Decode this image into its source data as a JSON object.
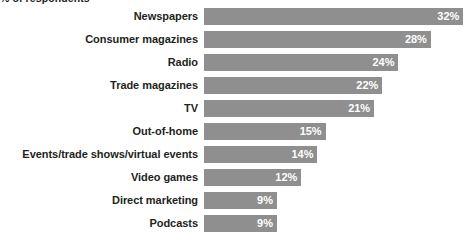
{
  "chart_data": {
    "type": "bar",
    "orientation": "horizontal",
    "title": "",
    "subtitle": "",
    "axis_note": "% of respondents",
    "xlabel": "",
    "ylabel": "",
    "grid": false,
    "legend": null,
    "value_suffix": "%",
    "xlim": [
      0,
      32
    ],
    "bar_color": "#8f8f8f",
    "value_label_color": "#ffffff",
    "category_label_color": "#231f20",
    "background_color": "#ffffff",
    "categories": [
      "Newspapers",
      "Consumer magazines",
      "Radio",
      "Trade magazines",
      "TV",
      "Out-of-home",
      "Events/trade shows/virtual events",
      "Video games",
      "Direct marketing",
      "Podcasts"
    ],
    "values": [
      32,
      28,
      24,
      22,
      21,
      15,
      14,
      12,
      9,
      9
    ],
    "value_labels": [
      "32%",
      "28%",
      "24%",
      "22%",
      "21%",
      "15%",
      "14%",
      "12%",
      "9%",
      "9%"
    ]
  }
}
